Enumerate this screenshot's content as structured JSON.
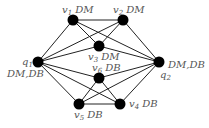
{
  "graph": {
    "nodes": [
      {
        "id": "v1",
        "name": "v",
        "sub": "1",
        "tag": "DM",
        "x": 73,
        "y": 20,
        "lx": 62,
        "ly": 13
      },
      {
        "id": "v2",
        "name": "v",
        "sub": "2",
        "tag": "DM",
        "x": 123,
        "y": 20,
        "lx": 113,
        "ly": 13
      },
      {
        "id": "v3",
        "name": "v",
        "sub": "3",
        "tag": "DM",
        "x": 99,
        "y": 46,
        "lx": 88,
        "ly": 60
      },
      {
        "id": "q1",
        "name": "q",
        "sub": "1",
        "tag": "",
        "x": 38,
        "y": 62,
        "lx": 22,
        "ly": 65
      },
      {
        "id": "q2",
        "name": "q",
        "sub": "2",
        "tag": "",
        "x": 159,
        "y": 62,
        "lx": 160,
        "ly": 78
      },
      {
        "id": "v6",
        "name": "v",
        "sub": "6",
        "tag": "DB",
        "x": 99,
        "y": 78,
        "lx": 92,
        "ly": 71
      },
      {
        "id": "v5",
        "name": "v",
        "sub": "5",
        "tag": "DB",
        "x": 79,
        "y": 104,
        "lx": 74,
        "ly": 118
      },
      {
        "id": "v4",
        "name": "v",
        "sub": "4",
        "tag": "DB",
        "x": 120,
        "y": 104,
        "lx": 129,
        "ly": 107
      }
    ],
    "extra_labels": [
      {
        "text": "DM,DB",
        "x": 7,
        "y": 77
      },
      {
        "text": "DM,DB",
        "x": 168,
        "y": 68
      }
    ],
    "edges": [
      [
        "v1",
        "v2"
      ],
      [
        "v1",
        "v3"
      ],
      [
        "v2",
        "v3"
      ],
      [
        "q1",
        "v1"
      ],
      [
        "q1",
        "v2"
      ],
      [
        "q1",
        "v3"
      ],
      [
        "q2",
        "v1"
      ],
      [
        "q2",
        "v2"
      ],
      [
        "q2",
        "v3"
      ],
      [
        "q1",
        "v6"
      ],
      [
        "q1",
        "v5"
      ],
      [
        "q1",
        "v4"
      ],
      [
        "q2",
        "v6"
      ],
      [
        "q2",
        "v5"
      ],
      [
        "q2",
        "v4"
      ],
      [
        "v5",
        "v4"
      ],
      [
        "v5",
        "v6"
      ],
      [
        "v4",
        "v6"
      ]
    ],
    "node_color": "#000000",
    "edge_color": "#222222"
  }
}
